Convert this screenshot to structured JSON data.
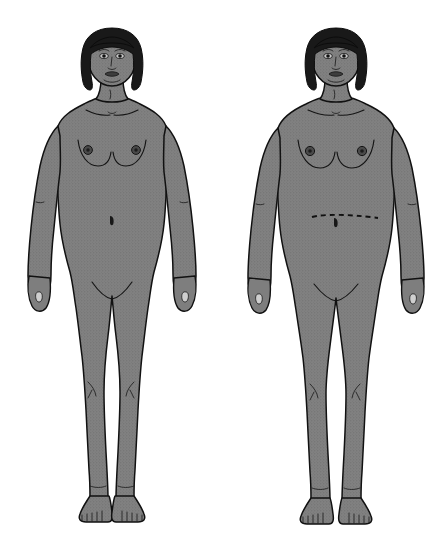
{
  "plate": {
    "title": "Anthropometric body outline figures",
    "background_color": "#ffffff",
    "width": 448,
    "height": 541,
    "figure_count": 2,
    "view": "anterior",
    "style": "line drawing with stippled gray fill"
  },
  "palette": {
    "background": "#ffffff",
    "skin_fill": "#7e7e7e",
    "skin_stipple_dot": "#6a6a6a",
    "outline": "#111111",
    "hair": "#191919",
    "areola": "#4a4a4a",
    "nipple": "#1c1c1c",
    "marker_line": "#101010",
    "nail": "#cfcfcf"
  },
  "figures": [
    {
      "id": "figure-left",
      "position": "left",
      "label": "Left figure",
      "sex_presentation": "female",
      "build": "slender",
      "pose": "standing anterior, arms at sides, palms medial",
      "hair_style": "short bob with fringe",
      "hair_color": "#191919",
      "skin_tone": "#7e7e7e",
      "waist_marker": "none",
      "navel_visible": "yes",
      "features": [
        "head",
        "bob-hair",
        "eyes",
        "nose",
        "mouth",
        "neck",
        "clavicles",
        "breasts",
        "areolae",
        "navel",
        "arms",
        "hands",
        "legs",
        "knees",
        "feet",
        "toes"
      ]
    },
    {
      "id": "figure-right",
      "position": "right",
      "label": "Right figure",
      "sex_presentation": "female",
      "build": "broader / heavier",
      "pose": "standing anterior, arms at sides, palms medial",
      "hair_style": "short bob with fringe",
      "hair_color": "#191919",
      "skin_tone": "#7e7e7e",
      "waist_marker": "dashed horizontal waist circumference line",
      "navel_visible": "yes",
      "features": [
        "head",
        "bob-hair",
        "eyes",
        "nose",
        "mouth",
        "neck",
        "clavicles",
        "breasts",
        "areolae",
        "waist-dashed-line",
        "navel",
        "arms",
        "hands",
        "legs",
        "knees",
        "feet",
        "toes"
      ]
    }
  ],
  "annotations": {
    "waist_line_label": "",
    "caption": ""
  }
}
